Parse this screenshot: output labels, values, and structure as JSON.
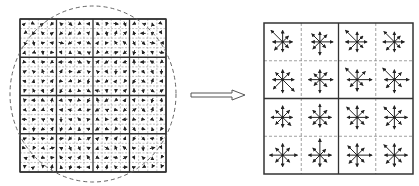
{
  "diagram": {
    "type": "sift-descriptor-illustration",
    "colors": {
      "background": "#ffffff",
      "line": "#333333",
      "dashed": "#666666",
      "arrow": "#222222"
    },
    "left_panel": {
      "label": "image-gradients",
      "grid_cells": 16,
      "block_divisions": 4,
      "has_gaussian_window_circle": true,
      "bounds": {
        "x": 20,
        "y": 19,
        "width": 146,
        "height": 153
      },
      "circle": {
        "cx": 93,
        "cy": 94,
        "rx": 83,
        "ry": 88
      }
    },
    "transition_arrow": {
      "direction": "right",
      "style": "hollow-outline",
      "bounds": {
        "x": 191,
        "y": 90,
        "width": 54,
        "height": 10
      }
    },
    "right_panel": {
      "label": "keypoint-descriptor",
      "grid_cells": 4,
      "block_divisions": 2,
      "histogram_bins": 8,
      "bounds": {
        "x": 264,
        "y": 23,
        "width": 149,
        "height": 151
      },
      "histograms": [
        [
          [
            6,
            5,
            7,
            10,
            6,
            7,
            6,
            5
          ],
          [
            8,
            6,
            6,
            7,
            5,
            6,
            8,
            5
          ],
          [
            6,
            5,
            6,
            10,
            7,
            7,
            6,
            5
          ],
          [
            6,
            5,
            6,
            9,
            7,
            7,
            6,
            5
          ]
        ],
        [
          [
            7,
            6,
            6,
            6,
            6,
            8,
            8,
            10
          ],
          [
            8,
            6,
            6,
            5,
            7,
            5,
            8,
            6
          ],
          [
            9,
            7,
            6,
            10,
            6,
            6,
            7,
            5
          ],
          [
            9,
            6,
            6,
            10,
            6,
            7,
            8,
            6
          ]
        ],
        [
          [
            6,
            6,
            7,
            6,
            7,
            6,
            6,
            7
          ],
          [
            7,
            6,
            8,
            6,
            7,
            6,
            6,
            6
          ],
          [
            7,
            6,
            7,
            9,
            6,
            6,
            7,
            6
          ],
          [
            8,
            6,
            7,
            9,
            6,
            7,
            7,
            6
          ]
        ],
        [
          [
            9,
            6,
            7,
            6,
            8,
            6,
            7,
            6
          ],
          [
            7,
            5,
            10,
            6,
            7,
            6,
            7,
            6
          ],
          [
            9,
            6,
            7,
            8,
            6,
            7,
            7,
            6
          ],
          [
            8,
            6,
            7,
            9,
            6,
            7,
            7,
            6
          ]
        ]
      ]
    }
  }
}
